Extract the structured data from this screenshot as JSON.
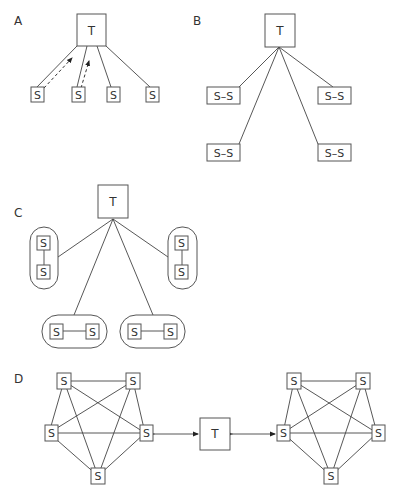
{
  "panels": {
    "A": {
      "label": "A",
      "hub": "T",
      "nodes": [
        "S",
        "S",
        "S",
        "S"
      ]
    },
    "B": {
      "label": "B",
      "hub": "T",
      "nodes": [
        "S–S",
        "S–S",
        "S–S",
        "S–S"
      ]
    },
    "C": {
      "label": "C",
      "hub": "T",
      "pair_node": "S",
      "pairs": 4
    },
    "D": {
      "label": "D",
      "hub": "T",
      "node": "S",
      "cluster_size": 5,
      "clusters": 2
    }
  },
  "colors": {
    "stroke": "#555555",
    "text": "#333333",
    "background": "#ffffff"
  }
}
